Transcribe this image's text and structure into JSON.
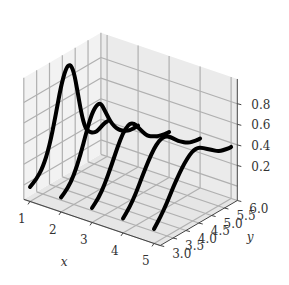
{
  "chart_data": {
    "type": "line",
    "projection": "3d",
    "title": "",
    "xlabel": "x",
    "ylabel": "y",
    "zlabel": "",
    "x_ticks": [
      "1",
      "2",
      "3",
      "4",
      "5"
    ],
    "y_ticks": [
      "3.0",
      "3.5",
      "4.0",
      "4.5",
      "5.0",
      "5.5",
      "6.0"
    ],
    "z_ticks": [
      "0.2",
      "0.4",
      "0.6",
      "0.8"
    ],
    "xlim": [
      0.8,
      5.2
    ],
    "ylim": [
      3.0,
      6.0
    ],
    "zlim": [
      -0.14,
      1.04
    ],
    "grid": true,
    "line_color": "#000000",
    "line_width": 4,
    "series": [
      {
        "name": "x=1",
        "x": 1,
        "y": [
          3.0,
          3.25,
          3.5,
          3.75,
          4.0,
          4.2,
          4.4,
          4.55,
          4.7,
          4.85,
          5.0,
          5.15,
          5.3,
          5.45,
          5.6,
          5.75,
          5.9,
          6.0
        ],
        "z": [
          0.0,
          0.04,
          0.12,
          0.28,
          0.55,
          0.8,
          0.95,
          0.97,
          0.88,
          0.66,
          0.42,
          0.26,
          0.2,
          0.17,
          0.16,
          0.18,
          0.2,
          0.2
        ]
      },
      {
        "name": "x=2",
        "x": 2,
        "y": [
          3.0,
          3.25,
          3.5,
          3.75,
          4.0,
          4.2,
          4.4,
          4.55,
          4.7,
          4.85,
          5.0,
          5.15,
          5.3,
          5.45,
          5.6,
          5.75,
          5.9,
          6.0
        ],
        "z": [
          0.0,
          0.05,
          0.14,
          0.3,
          0.5,
          0.64,
          0.7,
          0.69,
          0.6,
          0.5,
          0.42,
          0.36,
          0.32,
          0.29,
          0.27,
          0.26,
          0.26,
          0.26
        ]
      },
      {
        "name": "x=3",
        "x": 3,
        "y": [
          3.0,
          3.25,
          3.5,
          3.75,
          4.0,
          4.2,
          4.4,
          4.55,
          4.7,
          4.85,
          5.0,
          5.15,
          5.3,
          5.45,
          5.6,
          5.75,
          5.9,
          6.0
        ],
        "z": [
          0.0,
          0.06,
          0.16,
          0.3,
          0.45,
          0.55,
          0.6,
          0.6,
          0.56,
          0.5,
          0.44,
          0.39,
          0.36,
          0.34,
          0.32,
          0.31,
          0.3,
          0.3
        ]
      },
      {
        "name": "x=4",
        "x": 4,
        "y": [
          3.0,
          3.25,
          3.5,
          3.75,
          4.0,
          4.2,
          4.4,
          4.55,
          4.7,
          4.85,
          5.0,
          5.15,
          5.3,
          5.45,
          5.6,
          5.75,
          5.9,
          6.0
        ],
        "z": [
          0.0,
          0.07,
          0.17,
          0.3,
          0.42,
          0.5,
          0.55,
          0.56,
          0.55,
          0.52,
          0.48,
          0.44,
          0.41,
          0.38,
          0.36,
          0.35,
          0.34,
          0.34
        ]
      },
      {
        "name": "x=5",
        "x": 5,
        "y": [
          3.0,
          3.25,
          3.5,
          3.75,
          4.0,
          4.2,
          4.4,
          4.55,
          4.7,
          4.85,
          5.0,
          5.15,
          5.3,
          5.45,
          5.6,
          5.75,
          5.9,
          6.0
        ],
        "z": [
          0.0,
          0.08,
          0.18,
          0.3,
          0.4,
          0.47,
          0.52,
          0.54,
          0.54,
          0.52,
          0.49,
          0.46,
          0.43,
          0.4,
          0.38,
          0.37,
          0.36,
          0.36
        ]
      }
    ]
  },
  "layout": {
    "origin_px": [
      30,
      187
    ],
    "x_unit_px": [
      31,
      10.5
    ],
    "y_unit_px": [
      25.7,
      -15
    ],
    "z_unit_px": 103,
    "pane_color": "#ebebeb",
    "pane_color_left": "#f2f2f2",
    "floor_color": "#e6e6e6",
    "grid_color": "#b0b0b0",
    "edge_color": "#444444"
  }
}
